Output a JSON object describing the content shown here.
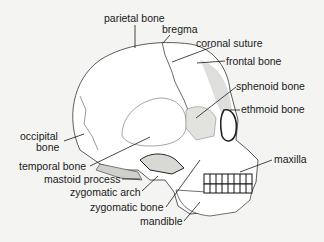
{
  "diagram": {
    "colors": {
      "background": "#f4f4f2",
      "ink": "#1a1a1a",
      "shade": "#b9b9b6"
    },
    "labels": [
      {
        "id": "parietal",
        "text": "parietal bone",
        "x": 104,
        "y": 13
      },
      {
        "id": "bregma",
        "text": "bregma",
        "x": 162,
        "y": 24
      },
      {
        "id": "coronal",
        "text": "coronal suture",
        "x": 196,
        "y": 38
      },
      {
        "id": "frontal",
        "text": "frontal bone",
        "x": 226,
        "y": 56
      },
      {
        "id": "sphenoid",
        "text": "sphenoid bone",
        "x": 236,
        "y": 81
      },
      {
        "id": "ethmoid",
        "text": "ethmoid bone",
        "x": 241,
        "y": 104
      },
      {
        "id": "occipital1",
        "text": "occipital",
        "x": 20,
        "y": 131
      },
      {
        "id": "occipital2",
        "text": "bone",
        "x": 36,
        "y": 142
      },
      {
        "id": "maxilla",
        "text": "maxilla",
        "x": 274,
        "y": 154
      },
      {
        "id": "temporal",
        "text": "temporal bone",
        "x": 19,
        "y": 161
      },
      {
        "id": "mastoid",
        "text": "mastoid process",
        "x": 44,
        "y": 174
      },
      {
        "id": "zygarch",
        "text": "zygomatic arch",
        "x": 70,
        "y": 187
      },
      {
        "id": "zygbone",
        "text": "zygomatic bone",
        "x": 90,
        "y": 202
      },
      {
        "id": "mandible",
        "text": "mandible",
        "x": 140,
        "y": 216
      }
    ]
  }
}
